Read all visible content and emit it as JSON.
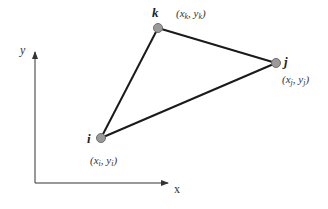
{
  "diagram": {
    "type": "triangle-element",
    "axes": {
      "x_label": "x",
      "y_label": "y"
    },
    "nodes": [
      {
        "id": "i",
        "label": "i",
        "coord_label": "(x_i, y_i)",
        "coord_main": "(x",
        "coord_sub1": "i",
        "coord_mid": ", y",
        "coord_sub2": "i",
        "coord_end": ")"
      },
      {
        "id": "j",
        "label": "j",
        "coord_label": "(x_j, y_j)",
        "coord_main": "(x",
        "coord_sub1": "j",
        "coord_mid": ", y",
        "coord_sub2": "j",
        "coord_end": ")"
      },
      {
        "id": "k",
        "label": "k",
        "coord_label": "(x_k, y_k)",
        "coord_main": "(x",
        "coord_sub1": "k",
        "coord_mid": ", y",
        "coord_sub2": "k",
        "coord_end": ")"
      }
    ],
    "edges": [
      [
        "i",
        "k"
      ],
      [
        "k",
        "j"
      ],
      [
        "j",
        "i"
      ]
    ],
    "colors": {
      "edge": "#1a1a1a",
      "node_fill": "#9a9a9a",
      "node_stroke": "#6e6e6e",
      "axis": "#333333"
    }
  }
}
